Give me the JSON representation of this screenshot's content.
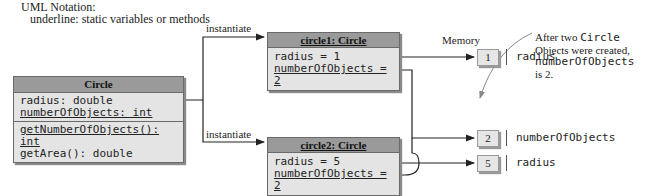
{
  "notation": {
    "title": "UML Notation:",
    "subtitle": "underline: static variables or methods"
  },
  "class_box": {
    "name": "Circle",
    "fields": [
      {
        "text": "radius: double",
        "static": false
      },
      {
        "text": "numberOfObjects: int",
        "static": true
      }
    ],
    "methods": [
      {
        "text": "getNumberOfObjects(): int",
        "static": true
      },
      {
        "text": "getArea(): double",
        "static": false
      }
    ]
  },
  "edges": {
    "instantiate_top": "instantiate",
    "instantiate_bottom": "instantiate"
  },
  "objects": [
    {
      "name": "circle1: Circle",
      "fields": [
        {
          "text": "radius = 1",
          "static": false
        },
        {
          "text": "numberOfObjects = 2",
          "static": true
        }
      ]
    },
    {
      "name": "circle2: Circle",
      "fields": [
        {
          "text": "radius = 5",
          "static": false
        },
        {
          "text": "numberOfObjects = 2",
          "static": true
        }
      ]
    }
  ],
  "memory": {
    "title": "Memory",
    "cells": [
      {
        "value": "1",
        "label": "radius"
      },
      {
        "value": "2",
        "label": "numberOfObjects"
      },
      {
        "value": "5",
        "label": "radius"
      }
    ]
  },
  "annotation": {
    "line1_pre": "After two ",
    "line1_code": "Circle",
    "line2": "Objects were created,",
    "line3_code": "numberOfObjects",
    "line4": "is 2."
  },
  "colors": {
    "header_gray": "#9a9a9a",
    "body_gray": "#e4e4e4",
    "line": "#222222",
    "annotation_arrow": "#999999"
  }
}
